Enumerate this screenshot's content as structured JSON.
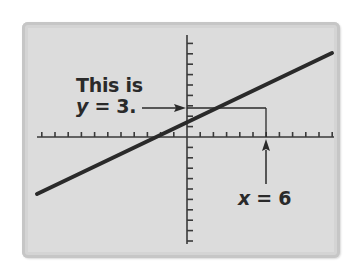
{
  "callouts": {
    "y_label_line1": "This is",
    "y_label_var": "y",
    "y_label_eq": " = 3.",
    "x_label_var": "x",
    "x_label_eq": " = 6"
  },
  "colors": {
    "panel": "#dcdcdc",
    "line": "#2a2a2a",
    "axis": "#3a3a3a"
  },
  "chart_data": {
    "type": "line",
    "title": "",
    "xlabel": "",
    "ylabel": "",
    "series": [
      {
        "name": "line",
        "x": [
          -11.3,
          11.0
        ],
        "y": [
          -5.9,
          8.6
        ]
      }
    ],
    "annotations": [
      {
        "text": "This is y = 3.",
        "points_to": {
          "axis": "y",
          "value": 3
        }
      },
      {
        "text": "x = 6",
        "points_to": {
          "axis": "x",
          "value": 6
        }
      }
    ],
    "highlighted_point": {
      "x": 6,
      "y": 3
    },
    "xlim": [
      -11,
      11
    ],
    "ylim": [
      -11,
      10
    ],
    "grid": false,
    "x_ticks_each_side": 11,
    "y_ticks_above": 10,
    "y_ticks_below": 10
  }
}
